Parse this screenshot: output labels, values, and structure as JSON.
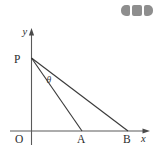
{
  "figure": {
    "background_color": "#ffffff",
    "axis_color": "#5a5a5a",
    "line_color": "#3a3a3a",
    "label_color": "#2b2b2b"
  },
  "axes": {
    "x_axis_label": "x",
    "y_axis_label": "y",
    "origin_label": "O"
  },
  "points": [
    {
      "id": "P",
      "label": "P",
      "x": 31,
      "y": 58,
      "on": "y-axis"
    },
    {
      "id": "A",
      "label": "A",
      "x": 82,
      "y": 131,
      "on": "x-axis"
    },
    {
      "id": "B",
      "label": "B",
      "x": 128,
      "y": 131,
      "on": "x-axis"
    },
    {
      "id": "O",
      "label": "O",
      "x": 31,
      "y": 131,
      "on": "origin"
    }
  ],
  "segments": [
    {
      "id": "PA",
      "from": "P",
      "to": "A"
    },
    {
      "id": "PB",
      "from": "P",
      "to": "B"
    }
  ],
  "angle": {
    "label": "θ",
    "vertex": "P",
    "between": "PA and PB"
  },
  "watermark": {
    "name": "three-block-mark",
    "color": "#8e8e8e",
    "blocks": 3
  }
}
